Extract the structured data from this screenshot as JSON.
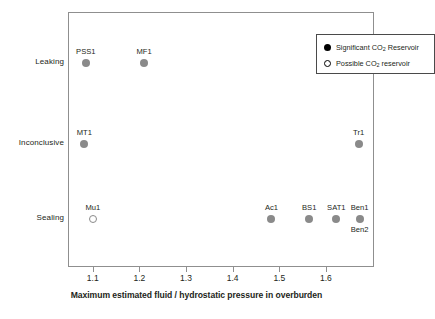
{
  "chart_data": {
    "type": "scatter",
    "title": "",
    "xlabel": "Maximum estimated fluid / hydrostatic pressure in overburden",
    "ylabel": "",
    "xlim": [
      1.047,
      1.703
    ],
    "xticks": [
      1.1,
      1.2,
      1.3,
      1.4,
      1.5,
      1.6
    ],
    "xticklabels": [
      "1.1",
      "1.2",
      "1.3",
      "1.4",
      "1.5",
      "1.6"
    ],
    "ycategories": [
      "Sealing",
      "Inconclusive",
      "Leaking"
    ],
    "grid": false,
    "legend_position": "top-right",
    "series": [
      {
        "name": "Significant CO2 Reservoir",
        "marker": "filled-circle",
        "color": "#8a8a8a",
        "points": [
          {
            "label": "PSS1",
            "x": 1.083,
            "y": "Leaking",
            "label_pos": "above"
          },
          {
            "label": "MF1",
            "x": 1.208,
            "y": "Leaking",
            "label_pos": "above"
          },
          {
            "label": "MT1",
            "x": 1.08,
            "y": "Inconclusive",
            "label_pos": "above"
          },
          {
            "label": "Tr1",
            "x": 1.668,
            "y": "Inconclusive",
            "label_pos": "above"
          },
          {
            "label": "Ac1",
            "x": 1.481,
            "y": "Sealing",
            "label_pos": "above"
          },
          {
            "label": "BS1",
            "x": 1.562,
            "y": "Sealing",
            "label_pos": "above"
          },
          {
            "label": "SAT1",
            "x": 1.62,
            "y": "Sealing",
            "label_pos": "above"
          },
          {
            "label": "Ben1",
            "x": 1.67,
            "y": "Sealing",
            "label_pos": "above"
          },
          {
            "label": "Ben2",
            "x": 1.67,
            "y": "Sealing",
            "label_pos": "below",
            "shares_marker": true
          }
        ]
      },
      {
        "name": "Possible CO2 reservoir",
        "marker": "hollow-circle",
        "color": "#8a8a8a",
        "points": [
          {
            "label": "Mu1",
            "x": 1.098,
            "y": "Sealing",
            "label_pos": "above"
          }
        ]
      }
    ]
  },
  "legend": {
    "entries": [
      {
        "marker": "filled-circle",
        "text_before": "Significant CO",
        "subscript": "2",
        "text_after": " Reservoir"
      },
      {
        "marker": "hollow-circle",
        "text_before": "Possible CO",
        "subscript": "2",
        "text_after": " reservoir"
      }
    ]
  },
  "axis": {
    "y_labels": [
      "Leaking",
      "Inconclusive",
      "Sealing"
    ],
    "x_title": "Maximum estimated fluid / hydrostatic pressure in overburden",
    "x_tick_labels": [
      "1.1",
      "1.2",
      "1.3",
      "1.4",
      "1.5",
      "1.6"
    ]
  }
}
